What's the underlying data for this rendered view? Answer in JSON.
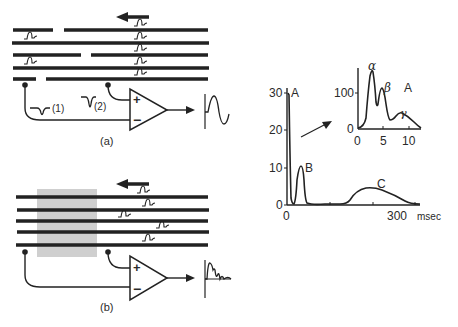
{
  "panel_a": {
    "label": "(a)",
    "input_labels": [
      "(1)",
      "(2)"
    ],
    "amplifier": {
      "plus": "+",
      "minus": "−"
    },
    "direction": "leftward",
    "fibers": [
      {
        "segments": [
          [
            13,
            53
          ],
          [
            64,
            208
          ]
        ],
        "y": 30,
        "spikes": [
          140
        ]
      },
      {
        "segments": [
          [
            12,
            209
          ]
        ],
        "y": 43,
        "spikes": [
          30,
          140
        ]
      },
      {
        "segments": [
          [
            13,
            81
          ],
          [
            91,
            208
          ]
        ],
        "y": 55,
        "spikes": [
          140
        ]
      },
      {
        "segments": [
          [
            13,
            209
          ]
        ],
        "y": 68,
        "spikes": [
          30,
          140
        ]
      },
      {
        "segments": [
          [
            13,
            36
          ],
          [
            46,
            208
          ]
        ],
        "y": 79,
        "spikes": [
          140
        ]
      }
    ]
  },
  "panel_b": {
    "label": "(b)",
    "amplifier": {
      "plus": "+",
      "minus": "−"
    },
    "direction": "leftward",
    "blocked_region": {
      "x": 37,
      "y": 189,
      "w": 60,
      "h": 68,
      "color": "#cfcfcf"
    },
    "fibers": [
      {
        "y": 197,
        "spike": 143
      },
      {
        "y": 210,
        "spike": 148
      },
      {
        "y": 221,
        "spike": 124
      },
      {
        "y": 232,
        "spike": 162
      },
      {
        "y": 245,
        "spike": 148
      }
    ]
  },
  "chart_data": [
    {
      "type": "line",
      "title": "",
      "xlabel": "msec",
      "ylabel": "",
      "x_ticks": [
        0,
        300
      ],
      "x_tick_labels": [
        "0",
        "300"
      ],
      "y_ticks": [
        0,
        10,
        20,
        30
      ],
      "y_tick_labels": [
        "0",
        "10",
        "20",
        "30"
      ],
      "xlim": [
        0,
        330
      ],
      "ylim": [
        0,
        31
      ],
      "peak_labels": [
        {
          "text": "A",
          "x": 5,
          "y": 30
        },
        {
          "text": "B",
          "x": 45,
          "y": 10.5
        },
        {
          "text": "C",
          "x": 260,
          "y": 5
        }
      ],
      "series": [
        {
          "name": "compound action potential",
          "x": [
            0,
            3,
            8,
            15,
            22,
            30,
            38,
            45,
            55,
            70,
            100,
            150,
            180,
            200,
            220,
            250,
            280,
            310,
            330
          ],
          "y": [
            30,
            28,
            8,
            1,
            2,
            9,
            10.5,
            6,
            1,
            0.3,
            0.3,
            0.3,
            3,
            4.6,
            4.8,
            4.0,
            2.5,
            0.6,
            0.4
          ]
        }
      ],
      "grid": false
    },
    {
      "type": "line",
      "title": "A (expanded)",
      "xlabel": "",
      "ylabel": "",
      "x_ticks": [
        0,
        5,
        10
      ],
      "x_tick_labels": [
        "0",
        "5",
        "10"
      ],
      "y_ticks": [
        0,
        100
      ],
      "y_tick_labels": [
        "0",
        "100"
      ],
      "xlim": [
        0,
        12
      ],
      "ylim": [
        0,
        160
      ],
      "peak_labels": [
        {
          "text": "α",
          "x": 3,
          "y": 155
        },
        {
          "text": "β",
          "x": 4.8,
          "y": 95
        },
        {
          "text": "γ",
          "x": 8,
          "y": 30
        }
      ],
      "series": [
        {
          "name": "A wave components",
          "x": [
            0,
            1.5,
            2.3,
            3.0,
            3.6,
            4.0,
            4.7,
            5.2,
            5.8,
            6.5,
            7.5,
            8.5,
            10,
            12
          ],
          "y": [
            2,
            10,
            80,
            155,
            110,
            55,
            95,
            60,
            15,
            18,
            30,
            22,
            8,
            2
          ]
        }
      ],
      "grid": false
    }
  ],
  "inset_label": "A",
  "axis_unit": "msec"
}
